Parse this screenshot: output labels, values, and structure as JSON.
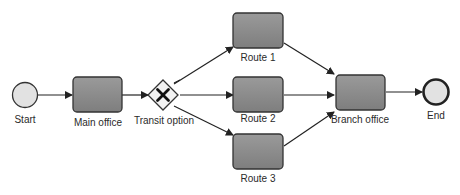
{
  "diagram": {
    "type": "bpmn-process",
    "colors": {
      "task_fill": "#8a8a8a",
      "task_stroke": "#333333",
      "event_fill": "#e2e2e2",
      "line": "#222222"
    },
    "nodes": {
      "start": {
        "label": "Start",
        "kind": "start-event"
      },
      "main_office": {
        "label": "Main office",
        "kind": "task"
      },
      "transit_option": {
        "label": "Transit option",
        "kind": "exclusive-gateway"
      },
      "route1": {
        "label": "Route 1",
        "kind": "task"
      },
      "route2": {
        "label": "Route 2",
        "kind": "task"
      },
      "route3": {
        "label": "Route 3",
        "kind": "task"
      },
      "branch_office": {
        "label": "Branch office",
        "kind": "task"
      },
      "end": {
        "label": "End",
        "kind": "end-event"
      }
    },
    "edges": [
      {
        "from": "Start",
        "to": "Main office"
      },
      {
        "from": "Main office",
        "to": "Transit option"
      },
      {
        "from": "Transit option",
        "to": "Route 1",
        "default": true
      },
      {
        "from": "Transit option",
        "to": "Route 2"
      },
      {
        "from": "Transit option",
        "to": "Route 3"
      },
      {
        "from": "Route 1",
        "to": "Branch office"
      },
      {
        "from": "Route 2",
        "to": "Branch office"
      },
      {
        "from": "Route 3",
        "to": "Branch office"
      },
      {
        "from": "Branch office",
        "to": "End"
      }
    ]
  }
}
